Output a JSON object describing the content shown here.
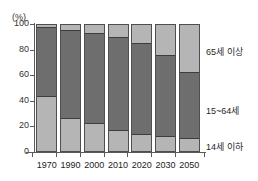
{
  "chart_data": {
    "type": "bar",
    "stacked": true,
    "title": "",
    "xlabel": "",
    "ylabel": "(%)",
    "ylim": [
      0,
      100
    ],
    "yticks": [
      0,
      20,
      40,
      60,
      80,
      100
    ],
    "ytick_labels": [
      "0",
      "20",
      "40",
      "60",
      "80",
      "100"
    ],
    "grid": false,
    "legend_position": "right",
    "categories": [
      "1970",
      "1990",
      "2000",
      "2010",
      "2020",
      "2030",
      "2050"
    ],
    "series": [
      {
        "name": "14세 이하",
        "color": "#b5b5b5",
        "values": [
          42,
          25,
          21,
          16,
          12.5,
          11,
          9
        ]
      },
      {
        "name": "15~64세",
        "color": "#6e6e6e",
        "values": [
          55,
          69.5,
          71,
          73,
          71.5,
          64,
          53
        ]
      },
      {
        "name": "65세 이상",
        "color": "#b5b5b5",
        "values": [
          3,
          5.5,
          8,
          11,
          16,
          25,
          38
        ]
      }
    ]
  },
  "axis": {
    "unit_label": "(%)"
  },
  "legend": {
    "old_label": "65세 이상",
    "work_label": "15~64세",
    "young_label": "14세 이하"
  },
  "colors": {
    "light_gray": "#b5b5b5",
    "dark_gray": "#6e6e6e",
    "outline": "#4f4f4f",
    "background": "#ffffff"
  }
}
